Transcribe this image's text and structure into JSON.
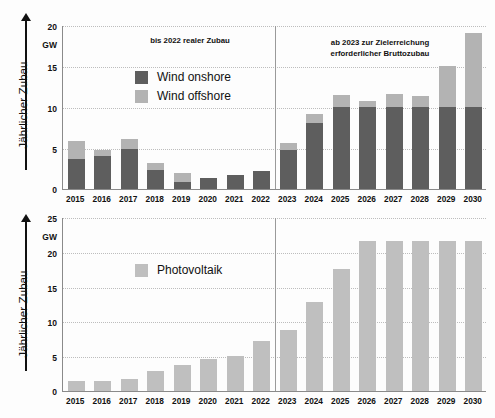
{
  "charts": [
    {
      "id": "wind",
      "axis_title": "Jährlicher Zubau",
      "unit": "GW",
      "yticks": [
        "20",
        "15",
        "10",
        "5",
        "0"
      ],
      "annotation_left": "bis 2022 realer Zubau",
      "annotation_right": "ab 2023 zur Zielerreichung\nerforderlicher Bruttozubau",
      "legend": [
        {
          "label": "Wind onshore",
          "color": "#5e5e5e"
        },
        {
          "label": "Wind offshore",
          "color": "#b3b3b3"
        }
      ]
    },
    {
      "id": "pv",
      "axis_title": "Jährlicher Zubau",
      "unit": "GW",
      "yticks": [
        "25",
        "20",
        "15",
        "10",
        "5",
        "0"
      ],
      "legend": [
        {
          "label": "Photovoltaik",
          "color": "#bfbfbf"
        }
      ]
    }
  ],
  "chart_data": [
    {
      "type": "bar",
      "id": "wind",
      "title": "",
      "stacked": true,
      "xlabel": "",
      "ylabel": "Jährlicher Zubau",
      "yunit": "GW",
      "ylim": [
        0,
        20
      ],
      "yticks": [
        0,
        5,
        10,
        15,
        20
      ],
      "grid": true,
      "legend_position": "inside-top-left",
      "divider_after_category": "2022",
      "annotations": [
        {
          "text": "bis 2022 realer Zubau",
          "region": "2015-2022"
        },
        {
          "text": "ab 2023 zur Zielerreichung erforderlicher Bruttozubau",
          "region": "2023-2030"
        }
      ],
      "categories": [
        "2015",
        "2016",
        "2017",
        "2018",
        "2019",
        "2020",
        "2021",
        "2022",
        "2023",
        "2024",
        "2025",
        "2026",
        "2027",
        "2028",
        "2029",
        "2030"
      ],
      "series": [
        {
          "name": "Wind onshore",
          "color": "#5e5e5e",
          "values": [
            3.7,
            4.0,
            4.9,
            2.3,
            0.9,
            1.4,
            1.7,
            2.2,
            4.7,
            8.0,
            10.0,
            10.0,
            10.0,
            10.0,
            10.0,
            10.0
          ]
        },
        {
          "name": "Wind offshore",
          "color": "#b3b3b3",
          "values": [
            2.2,
            0.8,
            1.2,
            0.9,
            1.1,
            0.0,
            0.0,
            0.0,
            0.9,
            1.2,
            1.5,
            0.7,
            1.6,
            1.4,
            5.0,
            9.0
          ]
        }
      ],
      "totals": [
        5.9,
        4.8,
        6.1,
        3.2,
        2.0,
        1.4,
        1.7,
        2.2,
        5.6,
        9.2,
        11.5,
        10.7,
        11.6,
        11.4,
        15.0,
        19.0
      ]
    },
    {
      "type": "bar",
      "id": "pv",
      "title": "",
      "stacked": false,
      "xlabel": "",
      "ylabel": "Jährlicher Zubau",
      "yunit": "GW",
      "ylim": [
        0,
        25
      ],
      "yticks": [
        0,
        5,
        10,
        15,
        20,
        25
      ],
      "grid": true,
      "legend_position": "inside-top-left",
      "divider_after_category": "2022",
      "categories": [
        "2015",
        "2016",
        "2017",
        "2018",
        "2019",
        "2020",
        "2021",
        "2022",
        "2023",
        "2024",
        "2025",
        "2026",
        "2027",
        "2028",
        "2029",
        "2030"
      ],
      "series": [
        {
          "name": "Photovoltaik",
          "color": "#bfbfbf",
          "values": [
            1.4,
            1.5,
            1.7,
            2.9,
            3.8,
            4.6,
            5.0,
            7.2,
            8.8,
            12.8,
            17.5,
            21.5,
            21.5,
            21.5,
            21.5,
            21.5
          ]
        }
      ]
    }
  ]
}
